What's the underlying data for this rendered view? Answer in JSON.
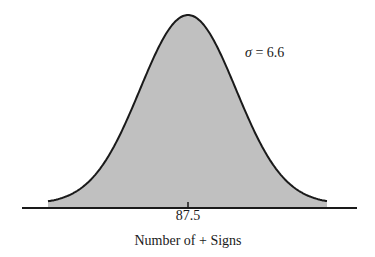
{
  "chart_data": {
    "type": "area",
    "title": "",
    "subtitle": "",
    "distribution": "normal",
    "mean": 87.5,
    "std_dev": 6.6,
    "xlabel": "Number of + Signs",
    "ylabel": "",
    "x_ticks": [
      87.5
    ],
    "x_tick_labels": [
      "87.5"
    ],
    "annotations": [
      {
        "text": "σ = 6.6",
        "position": "upper-right of peak"
      }
    ],
    "xlim": [
      66.0,
      109.0
    ],
    "grid": false,
    "legend": null,
    "fill_color": "#c0c0c0",
    "line_color": "#1a1a1a"
  },
  "labels": {
    "tick": "87.5",
    "xaxis": "Number of + Signs",
    "sigma_symbol": "σ",
    "sigma_rest": " = 6.6"
  },
  "colors": {
    "fill": "#c0c0c0",
    "stroke": "#1a1a1a",
    "background": "#ffffff"
  }
}
